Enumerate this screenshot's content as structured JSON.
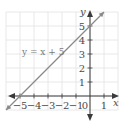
{
  "chart_data": {
    "type": "line",
    "title": "",
    "xlabel": "x",
    "ylabel": "y",
    "xlim": [
      -6,
      2
    ],
    "ylim": [
      -1,
      6
    ],
    "grid": true,
    "x_ticks": [
      -5,
      -4,
      -3,
      -2,
      -1,
      0,
      1
    ],
    "x_tick_labels": [
      "−5",
      "−4",
      "−3",
      "−2",
      "−1",
      "0",
      "1"
    ],
    "y_ticks": [
      1,
      2,
      3,
      4,
      5
    ],
    "y_tick_labels": [
      "1",
      "2",
      "3",
      "4",
      "5"
    ],
    "series": [
      {
        "name": "y = x + 5",
        "equation": "y = x + 5",
        "x": [
          -6,
          1
        ],
        "y": [
          -1,
          6
        ],
        "color": "#8a8a8a"
      }
    ],
    "annotations": [
      {
        "text": "y = x + 5",
        "x": -4.3,
        "y": 3.8
      }
    ]
  },
  "colors": {
    "grid": "#e2e2e2",
    "axis": "#3a3a3a",
    "line": "#8a8a8a"
  }
}
